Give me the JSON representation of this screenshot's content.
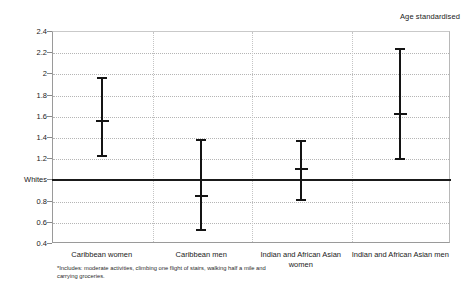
{
  "caption": "Age standardised",
  "footnote": "*Includes: moderate activities, climbing one flight of stairs, walking half a mile and carrying groceries.",
  "reference_label": "Whites",
  "chart_data": {
    "type": "scatter",
    "title": "",
    "subtitle": "Age standardised",
    "xlabel": "",
    "ylabel": "",
    "ylim": [
      0.4,
      2.4
    ],
    "yticks": [
      0.4,
      0.6,
      0.8,
      1.0,
      1.2,
      1.4,
      1.6,
      1.8,
      2.0,
      2.2,
      2.4
    ],
    "ytick_labels": [
      "0.4",
      "0.6",
      "0.8",
      "Whites",
      "1.2",
      "1.4",
      "1.6",
      "1.8",
      "2",
      "2.2",
      "2.4"
    ],
    "grid": true,
    "legend": "none",
    "reference_line": {
      "value": 1.0,
      "label": "Whites"
    },
    "categories": [
      "Caribbean women",
      "Caribbean men",
      "Indian and African Asian women",
      "Indian and African Asian men"
    ],
    "series": [
      {
        "name": "Odds ratio (95% CI)",
        "points": [
          {
            "category": "Caribbean women",
            "value": 1.55,
            "low": 1.22,
            "high": 1.96
          },
          {
            "category": "Caribbean men",
            "value": 0.84,
            "low": 0.52,
            "high": 1.37
          },
          {
            "category": "Indian and African Asian women",
            "value": 1.1,
            "low": 0.81,
            "high": 1.36
          },
          {
            "category": "Indian and African Asian men",
            "value": 1.62,
            "low": 1.19,
            "high": 2.23
          }
        ]
      }
    ]
  }
}
